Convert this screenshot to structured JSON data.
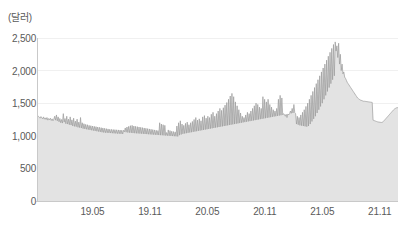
{
  "chart_data": {
    "type": "area",
    "title": "",
    "subtitle": "",
    "xlabel": "",
    "ylabel": "",
    "yunit": "(달러)",
    "grid": true,
    "legend": null,
    "ylim": [
      0,
      2500
    ],
    "yticks": [
      0,
      500,
      1000,
      1500,
      2000,
      2500
    ],
    "ytick_labels": [
      "0",
      "500",
      "1,000",
      "1,500",
      "2,000",
      "2,500"
    ],
    "xtick_labels": [
      "19.05",
      "19.11",
      "20.05",
      "20.11",
      "21.05",
      "21.11"
    ],
    "xtick_positions": [
      0.1523,
      0.3117,
      0.4711,
      0.6305,
      0.7899,
      0.9493
    ],
    "line_color": "#9b9b9b",
    "fill_color": "#e3e3e3",
    "grid_color": "#f0f0f0",
    "axis_color": "#c9c9c9",
    "x_start": "18.11",
    "x_end": "22.02",
    "series": [
      {
        "name": "dollar-value",
        "values": [
          1290,
          1300,
          1285,
          1270,
          1295,
          1275,
          1260,
          1290,
          1255,
          1275,
          1250,
          1280,
          1240,
          1265,
          1245,
          1270,
          1235,
          1260,
          1230,
          1255,
          1300,
          1240,
          1320,
          1230,
          1290,
          1215,
          1265,
          1200,
          1250,
          1195,
          1340,
          1210,
          1265,
          1185,
          1300,
          1180,
          1255,
          1170,
          1290,
          1165,
          1245,
          1150,
          1270,
          1145,
          1225,
          1140,
          1255,
          1130,
          1210,
          1125,
          1280,
          1120,
          1200,
          1110,
          1185,
          1105,
          1175,
          1100,
          1170,
          1095,
          1160,
          1090,
          1155,
          1085,
          1150,
          1080,
          1145,
          1075,
          1140,
          1070,
          1135,
          1065,
          1130,
          1060,
          1125,
          1055,
          1120,
          1050,
          1115,
          1048,
          1110,
          1046,
          1105,
          1044,
          1100,
          1042,
          1098,
          1040,
          1096,
          1038,
          1094,
          1036,
          1092,
          1034,
          1090,
          1032,
          1088,
          1030,
          1086,
          1028,
          1085,
          1060,
          1120,
          1055,
          1135,
          1050,
          1145,
          1048,
          1155,
          1045,
          1160,
          1042,
          1150,
          1040,
          1145,
          1038,
          1140,
          1036,
          1135,
          1034,
          1130,
          1032,
          1125,
          1030,
          1120,
          1028,
          1115,
          1026,
          1110,
          1024,
          1105,
          1022,
          1100,
          1020,
          1095,
          1018,
          1090,
          1016,
          1085,
          1014,
          1080,
          1012,
          1200,
          1010,
          1180,
          1008,
          1170,
          1006,
          1160,
          1004,
          1050,
          1002,
          1090,
          1000,
          1080,
          998,
          1070,
          996,
          1065,
          994,
          1060,
          992,
          1150,
          990,
          1200,
          1010,
          1230,
          1020,
          1180,
          1030,
          1160,
          1035,
          1190,
          1040,
          1210,
          1045,
          1170,
          1050,
          1200,
          1055,
          1220,
          1060,
          1250,
          1065,
          1280,
          1070,
          1240,
          1075,
          1260,
          1080,
          1230,
          1085,
          1290,
          1090,
          1310,
          1095,
          1270,
          1100,
          1300,
          1105,
          1280,
          1110,
          1330,
          1115,
          1360,
          1120,
          1300,
          1125,
          1340,
          1130,
          1380,
          1135,
          1420,
          1140,
          1390,
          1145,
          1430,
          1150,
          1470,
          1155,
          1510,
          1160,
          1560,
          1165,
          1610,
          1170,
          1650,
          1175,
          1600,
          1180,
          1520,
          1185,
          1460,
          1190,
          1400,
          1195,
          1350,
          1200,
          1300,
          1205,
          1280,
          1210,
          1320,
          1215,
          1360,
          1220,
          1340,
          1225,
          1380,
          1230,
          1420,
          1235,
          1460,
          1240,
          1500,
          1245,
          1480,
          1250,
          1440,
          1255,
          1420,
          1260,
          1600,
          1265,
          1560,
          1270,
          1520,
          1275,
          1560,
          1280,
          1480,
          1285,
          1440,
          1290,
          1400,
          1295,
          1380,
          1300,
          1420,
          1305,
          1560,
          1310,
          1620,
          1315,
          1580,
          1320,
          1340,
          1325,
          1300,
          1330,
          1280,
          1335,
          1320,
          1340,
          1380,
          1345,
          1420,
          1350,
          1480,
          1355,
          1340,
          1180,
          1300,
          1170,
          1280,
          1160,
          1320,
          1155,
          1360,
          1150,
          1400,
          1145,
          1450,
          1140,
          1500,
          1150,
          1560,
          1180,
          1620,
          1220,
          1680,
          1260,
          1740,
          1300,
          1800,
          1350,
          1860,
          1400,
          1920,
          1450,
          1980,
          1500,
          2040,
          1560,
          2100,
          1620,
          2160,
          1680,
          2220,
          1740,
          2280,
          1800,
          2340,
          1860,
          2400,
          1920,
          2440,
          2300,
          2380,
          2200,
          2420,
          2100,
          2250,
          2000,
          2100,
          1950,
          1980,
          1900,
          1880,
          1850,
          1820,
          1800,
          1780,
          1760,
          1740,
          1720,
          1700,
          1680,
          1660,
          1640,
          1620,
          1600,
          1580,
          1570,
          1560,
          1550,
          1545,
          1540,
          1535,
          1530,
          1530,
          1528,
          1526,
          1524,
          1522,
          1520,
          1518,
          1516,
          1514,
          1512,
          1240,
          1235,
          1230,
          1225,
          1220,
          1215,
          1212,
          1210,
          1208,
          1206,
          1205,
          1210,
          1220,
          1235,
          1250,
          1265,
          1280,
          1295,
          1310,
          1325,
          1340,
          1355,
          1370,
          1385,
          1400,
          1412,
          1420,
          1428,
          1432,
          1430
        ]
      }
    ],
    "annotations": {
      "peak_value": 2440,
      "peak_label": "21.05",
      "start_value": 1290,
      "end_value": 1430
    }
  },
  "caption": {
    "text": ""
  }
}
